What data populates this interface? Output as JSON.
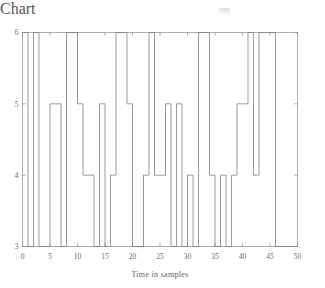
{
  "figure": {
    "background_color": "#ffffff",
    "line_color": "#7a7a7a",
    "axis_color": "#8d8d8d",
    "text_color": "#6a6a6a",
    "title": "",
    "artifact_note": "faint-smudge-mark"
  },
  "chart_data": {
    "type": "line",
    "style": "step-post",
    "title": "",
    "subtitle": "",
    "xlabel": "Time in samples",
    "ylabel": "",
    "xlim": [
      0,
      50
    ],
    "ylim": [
      3,
      6
    ],
    "grid": false,
    "legend": null,
    "xticks": [
      0,
      5,
      10,
      15,
      20,
      25,
      30,
      35,
      40,
      45,
      50
    ],
    "xticklabels": [
      "0",
      "5",
      "10",
      "15",
      "20",
      "25",
      "30",
      "35",
      "40",
      "45",
      "50"
    ],
    "yticks": [
      3,
      4,
      5,
      6
    ],
    "yticklabels": [
      "3",
      "4",
      "5",
      "6"
    ],
    "x": [
      0,
      1,
      2,
      3,
      4,
      5,
      6,
      7,
      8,
      9,
      10,
      11,
      12,
      13,
      14,
      15,
      16,
      17,
      18,
      19,
      20,
      21,
      22,
      23,
      24,
      25,
      26,
      27,
      28,
      29,
      30,
      31,
      32,
      33,
      34,
      35,
      36,
      37,
      38,
      39,
      40,
      41,
      42,
      43,
      44,
      45,
      46,
      47,
      48,
      49,
      50
    ],
    "values": [
      6,
      3,
      6,
      3,
      3,
      5,
      5,
      3,
      6,
      6,
      5,
      4,
      4,
      3,
      5,
      3,
      4,
      6,
      6,
      5,
      3,
      3,
      4,
      6,
      4,
      4,
      5,
      3,
      5,
      3,
      4,
      3,
      6,
      6,
      4,
      3,
      4,
      3,
      4,
      5,
      5,
      6,
      4,
      6,
      6,
      6,
      3,
      3,
      3,
      3,
      3
    ],
    "series": [
      {
        "name": "signal",
        "values": [
          6,
          3,
          6,
          3,
          3,
          5,
          5,
          3,
          6,
          6,
          5,
          4,
          4,
          3,
          5,
          3,
          4,
          6,
          6,
          5,
          3,
          3,
          4,
          6,
          4,
          4,
          5,
          3,
          5,
          3,
          4,
          3,
          6,
          6,
          4,
          3,
          4,
          3,
          4,
          5,
          5,
          6,
          4,
          6,
          6,
          6,
          3,
          3,
          3,
          3,
          3
        ]
      }
    ]
  },
  "axis": {
    "x_title": "Time in samples"
  }
}
